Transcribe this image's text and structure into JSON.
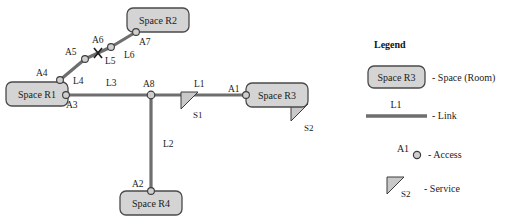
{
  "diagram": {
    "colors": {
      "room_fill": "#d4d4d4",
      "room_stroke": "#4a4a4a",
      "link_stroke": "#6e6e6e",
      "node_fill": "#cfcfcf",
      "node_stroke": "#3c3c3c",
      "service_fill": "#c9c9c9",
      "service_stroke": "#3c3c3c",
      "text": "#1b1b1b",
      "background": "#ffffff"
    },
    "rooms": [
      {
        "id": "R2",
        "label": "Space R2",
        "x": 127,
        "y": 8,
        "w": 62,
        "h": 24
      },
      {
        "id": "R1",
        "label": "Space R1",
        "x": 6,
        "y": 82,
        "w": 62,
        "h": 24
      },
      {
        "id": "R3",
        "label": "Space R3",
        "x": 246,
        "y": 83,
        "w": 62,
        "h": 24
      },
      {
        "id": "R4",
        "label": "Space R4",
        "x": 120,
        "y": 191,
        "w": 62,
        "h": 24
      }
    ],
    "accesses": [
      {
        "id": "A1",
        "label": "A1",
        "x": 246,
        "y": 95,
        "label_x": 228,
        "label_y": 91
      },
      {
        "id": "A2",
        "label": "A2",
        "x": 151,
        "y": 191,
        "label_x": 132,
        "label_y": 186
      },
      {
        "id": "A3",
        "label": "A3",
        "x": 66,
        "y": 95,
        "label_x": 66,
        "label_y": 108
      },
      {
        "id": "A4",
        "label": "A4",
        "x": 60,
        "y": 80,
        "label_x": 38,
        "label_y": 76
      },
      {
        "id": "A5",
        "label": "A5",
        "x": 85,
        "y": 59,
        "label_x": 66,
        "label_y": 54
      },
      {
        "id": "A6",
        "label": "A6",
        "x": 111,
        "y": 47,
        "label_x": 90,
        "label_y": 40
      },
      {
        "id": "A7",
        "label": "A7",
        "x": 136,
        "y": 32,
        "label_x": 138,
        "label_y": 45
      },
      {
        "id": "A8",
        "label": "A8",
        "x": 151,
        "y": 95,
        "label_x": 141,
        "label_y": 86
      }
    ],
    "links": [
      {
        "id": "L1",
        "label": "L1",
        "from": "A8",
        "to": "A1",
        "label_x": 195,
        "label_y": 85
      },
      {
        "id": "L2",
        "label": "L2",
        "from": "A8",
        "to": "A2",
        "label_x": 163,
        "label_y": 144
      },
      {
        "id": "L3",
        "label": "L3",
        "from": "A3",
        "to": "A8",
        "label_x": 107,
        "label_y": 84
      },
      {
        "id": "L4",
        "label": "L4",
        "from": "A4",
        "to": "A5",
        "label_x": 74,
        "label_y": 82
      },
      {
        "id": "L5",
        "label": "L5",
        "from": "A5",
        "to": "A6",
        "label_x": 113,
        "label_y": 63
      },
      {
        "id": "L6",
        "label": "L6",
        "from": "A6",
        "to": "A7",
        "label_x": 125,
        "label_y": 58
      }
    ],
    "link_break_marker": {
      "on_link": "L5",
      "x": 98,
      "y": 53,
      "size": 5
    },
    "services": [
      {
        "id": "S1",
        "label": "S1",
        "x": 181,
        "y": 92,
        "w": 17,
        "h": 17,
        "label_x": 194,
        "label_y": 117
      },
      {
        "id": "S2",
        "label": "S2",
        "x": 291,
        "y": 104,
        "w": 17,
        "h": 17,
        "label_x": 305,
        "label_y": 130
      }
    ]
  },
  "legend": {
    "title": "Legend",
    "items": [
      {
        "key": "space",
        "sample": "Space R3",
        "text": "- Space (Room)"
      },
      {
        "key": "link",
        "sample": "L1",
        "text": "- Link"
      },
      {
        "key": "access",
        "sample": "A1",
        "text": "- Access"
      },
      {
        "key": "service",
        "sample": "S2",
        "text": "- Service"
      }
    ]
  }
}
